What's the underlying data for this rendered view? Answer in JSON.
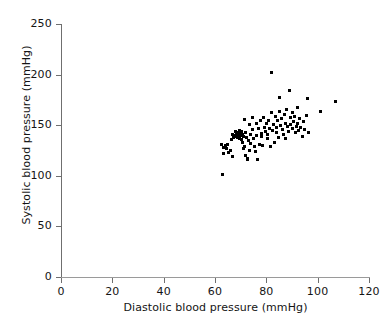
{
  "chart_data": {
    "type": "scatter",
    "title": "",
    "xlabel": "Diastolic blood pressure (mmHg)",
    "ylabel": "Systolic blood pressure (mmHg)",
    "xlim": [
      0,
      120
    ],
    "ylim": [
      0,
      250
    ],
    "xticks": [
      0,
      20,
      40,
      60,
      80,
      100,
      120
    ],
    "yticks": [
      0,
      50,
      100,
      150,
      200,
      250
    ],
    "xticklabels": [
      "0",
      "20",
      "40",
      "60",
      "80",
      "100",
      "120"
    ],
    "yticklabels": [
      "0",
      "50",
      "100",
      "150",
      "200",
      "250"
    ],
    "grid": false,
    "legend": false,
    "marker": "square",
    "marker_color": "#000000",
    "marker_size": 3,
    "series": [
      {
        "name": "Blood pressure readings",
        "points": [
          [
            62.5,
            131
          ],
          [
            63.0,
            101
          ],
          [
            63.2,
            128
          ],
          [
            63.5,
            122
          ],
          [
            64.0,
            130
          ],
          [
            64.5,
            127
          ],
          [
            65.0,
            131
          ],
          [
            65.2,
            123
          ],
          [
            66.0,
            125
          ],
          [
            66.3,
            136
          ],
          [
            66.8,
            141
          ],
          [
            67.0,
            119
          ],
          [
            67.2,
            138
          ],
          [
            67.5,
            140
          ],
          [
            67.8,
            144
          ],
          [
            68.0,
            139
          ],
          [
            68.2,
            142
          ],
          [
            68.4,
            140
          ],
          [
            68.6,
            138
          ],
          [
            68.8,
            143
          ],
          [
            69.0,
            141
          ],
          [
            69.2,
            139
          ],
          [
            69.4,
            145
          ],
          [
            69.6,
            137
          ],
          [
            69.8,
            142
          ],
          [
            70.0,
            140
          ],
          [
            70.2,
            144
          ],
          [
            70.4,
            136
          ],
          [
            70.6,
            141
          ],
          [
            70.8,
            133
          ],
          [
            71.0,
            139
          ],
          [
            71.2,
            127
          ],
          [
            71.4,
            156
          ],
          [
            71.6,
            129
          ],
          [
            71.8,
            120
          ],
          [
            72.0,
            143
          ],
          [
            72.2,
            138
          ],
          [
            72.5,
            116
          ],
          [
            72.8,
            117
          ],
          [
            73.0,
            135
          ],
          [
            73.3,
            151
          ],
          [
            73.5,
            125
          ],
          [
            73.8,
            141
          ],
          [
            74.0,
            132
          ],
          [
            74.5,
            146
          ],
          [
            74.8,
            158
          ],
          [
            75.0,
            137
          ],
          [
            75.3,
            129
          ],
          [
            75.6,
            124
          ],
          [
            76.0,
            152
          ],
          [
            76.3,
            140
          ],
          [
            76.6,
            116
          ],
          [
            77.0,
            147
          ],
          [
            77.4,
            131
          ],
          [
            77.8,
            155
          ],
          [
            78.0,
            142
          ],
          [
            78.3,
            139
          ],
          [
            78.6,
            130
          ],
          [
            79.0,
            158
          ],
          [
            79.3,
            148
          ],
          [
            79.6,
            144
          ],
          [
            80.0,
            152
          ],
          [
            80.3,
            141
          ],
          [
            80.6,
            137
          ],
          [
            81.0,
            155
          ],
          [
            81.3,
            147
          ],
          [
            81.6,
            129
          ],
          [
            82.0,
            202
          ],
          [
            82.2,
            163
          ],
          [
            82.5,
            145
          ],
          [
            82.8,
            151
          ],
          [
            83.0,
            133
          ],
          [
            83.4,
            159
          ],
          [
            83.8,
            148
          ],
          [
            84.0,
            143
          ],
          [
            84.3,
            155
          ],
          [
            84.6,
            138
          ],
          [
            85.0,
            177
          ],
          [
            85.3,
            164
          ],
          [
            85.6,
            150
          ],
          [
            86.0,
            157
          ],
          [
            86.3,
            146
          ],
          [
            86.6,
            141
          ],
          [
            87.0,
            161
          ],
          [
            87.3,
            152
          ],
          [
            87.6,
            137
          ],
          [
            88.0,
            166
          ],
          [
            88.3,
            149
          ],
          [
            88.6,
            144
          ],
          [
            89.0,
            184
          ],
          [
            89.3,
            158
          ],
          [
            89.6,
            151
          ],
          [
            90.0,
            163
          ],
          [
            90.3,
            147
          ],
          [
            90.6,
            154
          ],
          [
            91.0,
            159
          ],
          [
            91.3,
            143
          ],
          [
            91.6,
            149
          ],
          [
            92.0,
            167
          ],
          [
            92.3,
            152
          ],
          [
            92.6,
            145
          ],
          [
            93.0,
            157
          ],
          [
            93.4,
            148
          ],
          [
            94.0,
            139
          ],
          [
            94.5,
            154
          ],
          [
            95.0,
            146
          ],
          [
            95.5,
            160
          ],
          [
            96.0,
            176
          ],
          [
            96.5,
            143
          ],
          [
            101.0,
            164
          ],
          [
            107.0,
            173
          ]
        ]
      }
    ]
  },
  "axes": {
    "x_axis_name": "x-axis",
    "y_axis_name": "y-axis"
  }
}
